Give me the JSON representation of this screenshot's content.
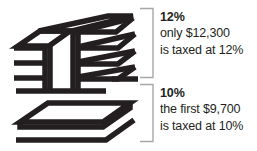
{
  "figure": {
    "title_text": "",
    "colors": {
      "ink": "#231f20",
      "bracket": "#a7a7a7",
      "background": "#ffffff"
    },
    "illustration_alt": "stack-of-slabs-diagram"
  },
  "tiers": [
    {
      "rate_label": "12%",
      "detail_line_1": "only $12,300",
      "detail_line_2": "is taxed at 12%",
      "bracket_name": "bracket-upper",
      "illustration_name": "slab-stack-upper"
    },
    {
      "rate_label": "10%",
      "detail_line_1": "the first $9,700",
      "detail_line_2": "is taxed at 10%",
      "bracket_name": "bracket-lower",
      "illustration_name": "slab-single-lower"
    }
  ]
}
